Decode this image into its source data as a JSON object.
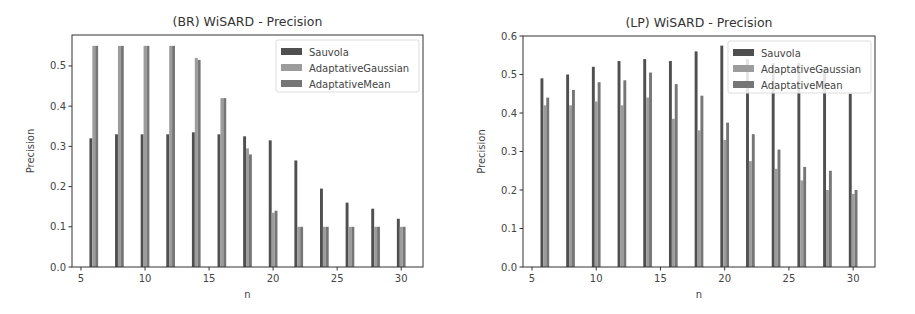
{
  "chart_data": [
    {
      "type": "bar",
      "title": "(BR) WiSARD - Precision",
      "xlabel": "n",
      "ylabel": "Precision",
      "x": [
        6,
        8,
        10,
        12,
        14,
        16,
        18,
        20,
        22,
        24,
        26,
        28,
        30
      ],
      "xticks": [
        5,
        10,
        15,
        20,
        25,
        30
      ],
      "yticks": [
        "0.0",
        "0.1",
        "0.2",
        "0.3",
        "0.4",
        "0.5"
      ],
      "xlim": [
        4.3,
        31.7
      ],
      "ylim": [
        0,
        0.577
      ],
      "grid": false,
      "legend_position": "upper right",
      "series": [
        {
          "name": "Sauvola",
          "color": "#4f4f4f",
          "values": [
            0.32,
            0.33,
            0.33,
            0.33,
            0.335,
            0.33,
            0.325,
            0.315,
            0.265,
            0.195,
            0.16,
            0.145,
            0.12
          ]
        },
        {
          "name": "AdaptativeGaussian",
          "color": "#9c9c9c",
          "values": [
            0.55,
            0.55,
            0.55,
            0.55,
            0.52,
            0.42,
            0.295,
            0.135,
            0.1,
            0.1,
            0.1,
            0.1,
            0.1
          ]
        },
        {
          "name": "AdaptativeMean",
          "color": "#767676",
          "values": [
            0.55,
            0.55,
            0.55,
            0.55,
            0.515,
            0.42,
            0.28,
            0.14,
            0.1,
            0.1,
            0.1,
            0.1,
            0.1
          ]
        }
      ]
    },
    {
      "type": "bar",
      "title": "(LP) WiSARD - Precision",
      "xlabel": "n",
      "ylabel": "Precision",
      "x": [
        6,
        8,
        10,
        12,
        14,
        16,
        18,
        20,
        22,
        24,
        26,
        28,
        30
      ],
      "xticks": [
        5,
        10,
        15,
        20,
        25,
        30
      ],
      "yticks": [
        "0.0",
        "0.1",
        "0.2",
        "0.3",
        "0.4",
        "0.5",
        "0.6"
      ],
      "xlim": [
        4.3,
        31.7
      ],
      "ylim": [
        0,
        0.6
      ],
      "grid": false,
      "legend_position": "upper right",
      "series": [
        {
          "name": "Sauvola",
          "color": "#4f4f4f",
          "values": [
            0.49,
            0.5,
            0.52,
            0.535,
            0.54,
            0.535,
            0.56,
            0.575,
            0.54,
            0.53,
            0.53,
            0.52,
            0.45
          ]
        },
        {
          "name": "AdaptativeGaussian",
          "color": "#9c9c9c",
          "values": [
            0.42,
            0.42,
            0.43,
            0.42,
            0.44,
            0.385,
            0.355,
            0.33,
            0.275,
            0.255,
            0.225,
            0.2,
            0.19
          ]
        },
        {
          "name": "AdaptativeMean",
          "color": "#767676",
          "values": [
            0.44,
            0.46,
            0.48,
            0.485,
            0.505,
            0.475,
            0.445,
            0.375,
            0.345,
            0.305,
            0.26,
            0.25,
            0.2
          ]
        }
      ]
    }
  ]
}
